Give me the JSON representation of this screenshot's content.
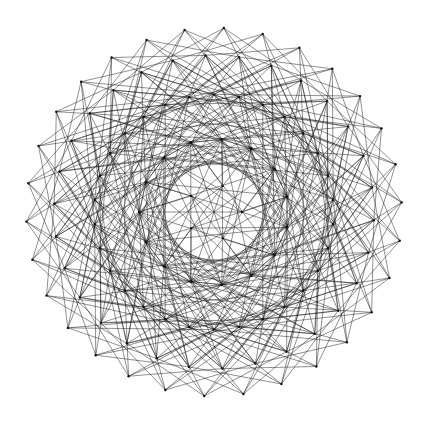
{
  "diagram": {
    "type": "graph-drawing",
    "background": "#ffffff",
    "edge_color": "#111111",
    "node_color": "#111111",
    "center": [
      214,
      212
    ],
    "rings": [
      {
        "name": "outer-spikes",
        "count": 30,
        "radius": 188,
        "phase_deg": 3
      },
      {
        "name": "outer-nodes",
        "count": 30,
        "radius": 160,
        "phase_deg": 9
      },
      {
        "name": "mid-nodes",
        "count": 30,
        "radius": 120,
        "phase_deg": 0
      },
      {
        "name": "inner-nodes",
        "count": 15,
        "radius": 75,
        "phase_deg": 6
      },
      {
        "name": "core-nodes",
        "count": 5,
        "radius": 28,
        "phase_deg": 18
      }
    ],
    "connection_rules": [
      {
        "from": "outer-spikes",
        "to": "mid-nodes",
        "offsets": [
          -4,
          -2,
          2,
          4
        ]
      },
      {
        "from": "outer-spikes",
        "to": "outer-nodes",
        "offsets": [
          -3,
          2
        ]
      },
      {
        "from": "outer-nodes",
        "to": "mid-nodes",
        "offsets": [
          -5,
          -1,
          3,
          6
        ]
      },
      {
        "from": "outer-nodes",
        "to": "inner-nodes",
        "offsets": [
          -2,
          1,
          4
        ]
      },
      {
        "from": "mid-nodes",
        "to": "mid-nodes",
        "offsets": [
          7,
          11
        ]
      },
      {
        "from": "mid-nodes",
        "to": "inner-nodes",
        "offsets": [
          -3,
          2
        ]
      },
      {
        "from": "inner-nodes",
        "to": "inner-nodes",
        "offsets": [
          4,
          6
        ]
      },
      {
        "from": "inner-nodes",
        "to": "core-nodes",
        "offsets": [
          0,
          2
        ]
      }
    ],
    "labels": []
  }
}
